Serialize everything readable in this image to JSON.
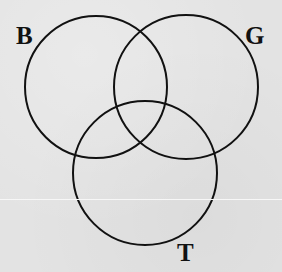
{
  "diagram": {
    "type": "venn",
    "sets": [
      {
        "id": "B",
        "label": "B",
        "cx": 96,
        "cy": 87,
        "r": 71
      },
      {
        "id": "G",
        "label": "G",
        "cx": 186,
        "cy": 87,
        "r": 72
      },
      {
        "id": "T",
        "label": "T",
        "cx": 145,
        "cy": 173,
        "r": 72
      }
    ],
    "stroke_color": "#111111",
    "background_color": "#e3e3e3"
  }
}
